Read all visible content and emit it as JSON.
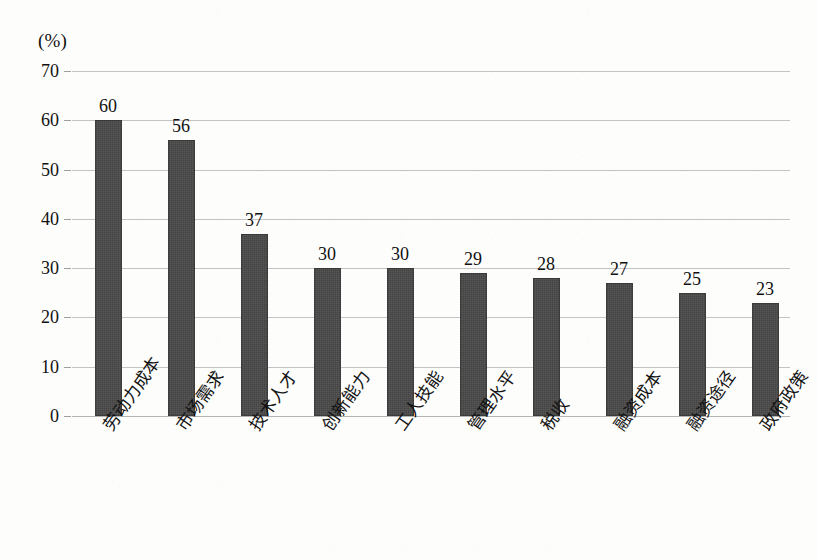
{
  "chart_data": {
    "type": "bar",
    "title": "",
    "subtitle": "",
    "xlabel": "",
    "ylabel": "",
    "unit_label": "(%)",
    "categories": [
      "劳动力成本",
      "市场需求",
      "技术人才",
      "创新能力",
      "工人技能",
      "管理水平",
      "税收",
      "融资成本",
      "融资途径",
      "政府政策"
    ],
    "values": [
      60,
      56,
      37,
      30,
      30,
      29,
      28,
      27,
      25,
      23
    ],
    "value_labels": [
      "60",
      "56",
      "37",
      "30",
      "30",
      "29",
      "28",
      "27",
      "25",
      "23"
    ],
    "ylim": [
      0,
      70
    ],
    "ytick_values": [
      0,
      10,
      20,
      30,
      40,
      50,
      60,
      70
    ],
    "ytick_labels": [
      "0",
      "10",
      "20",
      "30",
      "40",
      "50",
      "60",
      "70"
    ],
    "grid": true,
    "legend": false,
    "legend_position": "none",
    "bar_color": "#434343",
    "gridline_color": "#c3c3c3",
    "background_color": "#fdfdfc",
    "text_color": "#111111"
  }
}
